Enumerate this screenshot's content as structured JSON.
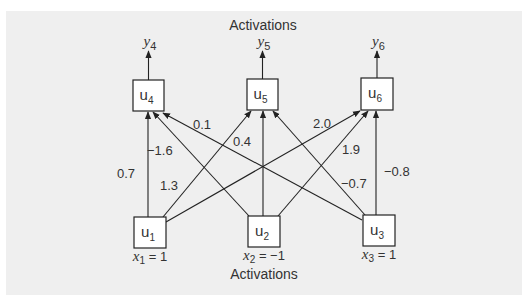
{
  "diagram": {
    "top_title": "Activations",
    "bottom_title": "Activations",
    "colors": {
      "panel": "#efefef",
      "line": "#222222",
      "text": "#333333",
      "box": "#ffffff"
    },
    "output_nodes": [
      {
        "id": "u4",
        "label": "u",
        "sub": "4",
        "output": "y",
        "output_sub": "4",
        "box": [
          133,
          80,
          31,
          31
        ]
      },
      {
        "id": "u5",
        "label": "u",
        "sub": "5",
        "output": "y",
        "output_sub": "5",
        "box": [
          247,
          79,
          31,
          31
        ]
      },
      {
        "id": "u6",
        "label": "u",
        "sub": "6",
        "output": "y",
        "output_sub": "6",
        "box": [
          361,
          78,
          32,
          32
        ]
      }
    ],
    "input_nodes": [
      {
        "id": "u1",
        "label": "u",
        "sub": "1",
        "input": "x",
        "input_sub": "1",
        "value_text": " = 1",
        "box": [
          134,
          217,
          32,
          31
        ]
      },
      {
        "id": "u2",
        "label": "u",
        "sub": "2",
        "input": "x",
        "input_sub": "2",
        "value_text": " = −1",
        "box": [
          248,
          216,
          32,
          31
        ]
      },
      {
        "id": "u3",
        "label": "u",
        "sub": "3",
        "input": "x",
        "input_sub": "3",
        "value_text": " = 1",
        "box": [
          363,
          215,
          32,
          31
        ]
      }
    ],
    "edges": [
      {
        "from": "u1",
        "to": "u4",
        "weight": "0.7",
        "x1": 148,
        "y1": 217,
        "x2": 148,
        "y2": 112,
        "lx": 117,
        "ly": 178
      },
      {
        "from": "u2",
        "to": "u4",
        "weight": "−1.6",
        "x1": 249,
        "y1": 216,
        "x2": 153,
        "y2": 112,
        "lx": 147,
        "ly": 155
      },
      {
        "from": "u3",
        "to": "u4",
        "weight": "0.1",
        "x1": 362,
        "y1": 220,
        "x2": 163,
        "y2": 113,
        "lx": 193,
        "ly": 129
      },
      {
        "from": "u1",
        "to": "u5",
        "weight": "1.3",
        "x1": 163,
        "y1": 217,
        "x2": 251,
        "y2": 111,
        "lx": 160,
        "ly": 190
      },
      {
        "from": "u2",
        "to": "u5",
        "weight": "0.4",
        "x1": 263,
        "y1": 216,
        "x2": 263,
        "y2": 111,
        "lx": 233,
        "ly": 146
      },
      {
        "from": "u3",
        "to": "u5",
        "weight": "−0.7",
        "x1": 365,
        "y1": 215,
        "x2": 273,
        "y2": 111,
        "lx": 341,
        "ly": 188
      },
      {
        "from": "u1",
        "to": "u6",
        "weight": "2.0",
        "x1": 166,
        "y1": 222,
        "x2": 360,
        "y2": 111,
        "lx": 313,
        "ly": 128
      },
      {
        "from": "u2",
        "to": "u6",
        "weight": "1.9",
        "x1": 278,
        "y1": 216,
        "x2": 368,
        "y2": 111,
        "lx": 342,
        "ly": 154
      },
      {
        "from": "u3",
        "to": "u6",
        "weight": "−0.8",
        "x1": 376,
        "y1": 215,
        "x2": 376,
        "y2": 111,
        "lx": 384,
        "ly": 176
      }
    ]
  }
}
